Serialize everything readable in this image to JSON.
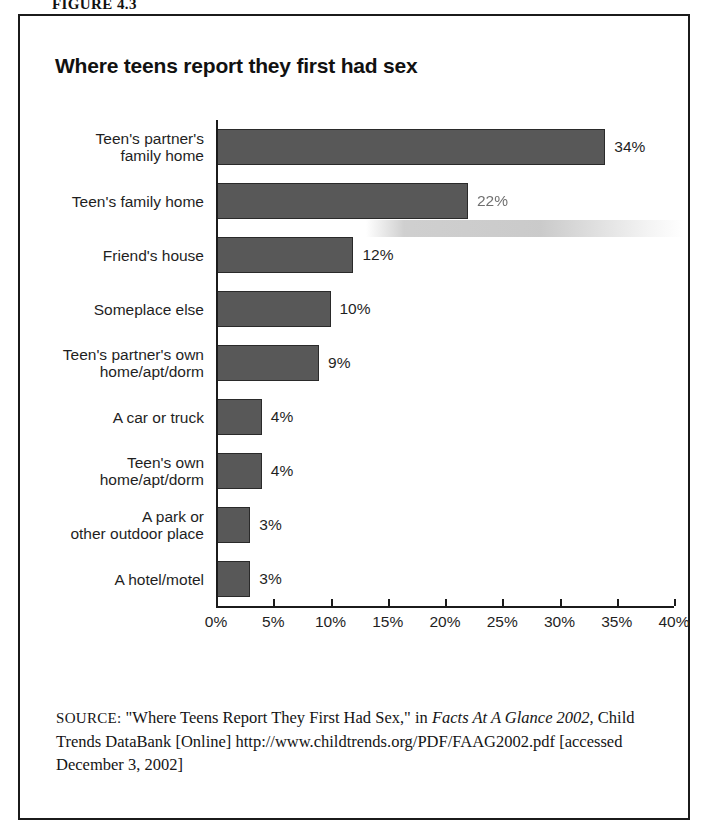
{
  "figure": {
    "caption": "FIGURE 4.3"
  },
  "chart_title": "Where teens report they first had sex",
  "chart_data": {
    "type": "bar",
    "orientation": "horizontal",
    "title": "Where teens report they first had sex",
    "xlabel": "",
    "ylabel": "",
    "xlim": [
      0,
      40
    ],
    "grid": false,
    "legend": null,
    "categories": [
      "Teen's partner's\nfamily home",
      "Teen's family home",
      "Friend's house",
      "Someplace else",
      "Teen's partner's own\nhome/apt/dorm",
      "A car or truck",
      "Teen's own\nhome/apt/dorm",
      "A park or\nother outdoor place",
      "A hotel/motel"
    ],
    "values": [
      34,
      22,
      12,
      10,
      9,
      4,
      4,
      3,
      3
    ],
    "value_labels": [
      "34%",
      "22%",
      "12%",
      "10%",
      "9%",
      "4%",
      "4%",
      "3%",
      "3%"
    ],
    "tick_values": [
      0,
      5,
      10,
      15,
      20,
      25,
      30,
      35,
      40
    ],
    "tick_labels": [
      "0%",
      "5%",
      "10%",
      "15%",
      "20%",
      "25%",
      "30%",
      "35%",
      "40%"
    ],
    "bar_color": "#585858",
    "bar_edge_color": "#2a2a2a"
  },
  "source": {
    "label": "SOURCE:",
    "line1_pre": " \"Where Teens Report They First Had Sex,\" in ",
    "italic1": "Facts At A Glance 2002,",
    "line1_post": " Child Trends DataBank [Online] http://www.childtrends.org/PDF/FAAG2002.pdf [accessed December 3, 2002]"
  }
}
